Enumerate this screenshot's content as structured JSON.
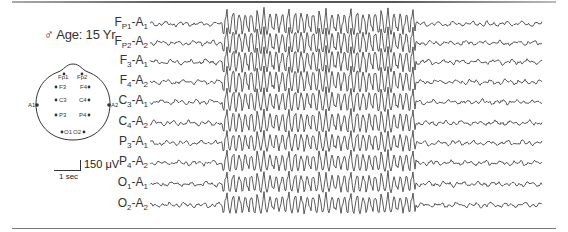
{
  "figure": {
    "subject": "♂ Age: 15 Yr",
    "scale": {
      "amplitude": "150 μV",
      "time": "1 sec"
    },
    "head_diagram": {
      "electrodes": [
        "Fp1",
        "Fp2",
        "F3",
        "F4",
        "C3",
        "C4",
        "P3",
        "P4",
        "O1",
        "O2",
        "A1",
        "A2"
      ]
    },
    "channels": [
      {
        "label": "Fp1-A1",
        "a": "F",
        "as": "P1",
        "b": "A",
        "bs": "1",
        "y": 24
      },
      {
        "label": "Fp2-A2",
        "a": "F",
        "as": "P2",
        "b": "A",
        "bs": "2",
        "y": 43
      },
      {
        "label": "F3-A1",
        "a": "F",
        "as": "3",
        "b": "A",
        "bs": "1",
        "y": 62
      },
      {
        "label": "F4-A2",
        "a": "F",
        "as": "4",
        "b": "A",
        "bs": "2",
        "y": 82
      },
      {
        "label": "C3-A1",
        "a": "C",
        "as": "3",
        "b": "A",
        "bs": "1",
        "y": 102
      },
      {
        "label": "C4-A2",
        "a": "C",
        "as": "4",
        "b": "A",
        "bs": "2",
        "y": 123
      },
      {
        "label": "P3-A1",
        "a": "P",
        "as": "3",
        "b": "A",
        "bs": "1",
        "y": 143
      },
      {
        "label": "P4-A2",
        "a": "P",
        "as": "4",
        "b": "A",
        "bs": "2",
        "y": 163
      },
      {
        "label": "O1-A1",
        "a": "O",
        "as": "1",
        "b": "A",
        "bs": "1",
        "y": 184
      },
      {
        "label": "O2-A2",
        "a": "O",
        "as": "2",
        "b": "A",
        "bs": "2",
        "y": 205
      }
    ],
    "burst": {
      "start_x": 222,
      "end_x": 415,
      "description": "Generalized 3 Hz spike-and-wave discharge"
    }
  }
}
